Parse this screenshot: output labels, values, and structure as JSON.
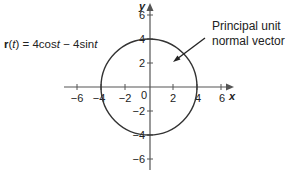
{
  "figure": {
    "equation": {
      "bold": "r",
      "open": "(",
      "var": "t",
      "close": ") = 4cos",
      "var2": "t",
      "mid": " − 4sin",
      "var3": "t"
    },
    "callout": {
      "line1": "Principal unit",
      "line2": "normal vector"
    },
    "axes": {
      "x_label": "x",
      "y_label": "y",
      "origin_label": "0",
      "x_ticks": [
        "−6",
        "−4",
        "−2",
        "2",
        "4",
        "6"
      ],
      "y_ticks": [
        "6",
        "4",
        "2",
        "−2",
        "−4",
        "−6"
      ]
    },
    "circle": {
      "center": [
        0,
        0
      ],
      "radius": 4
    },
    "colors": {
      "curve": "#333333",
      "axes": "#555555",
      "text": "#222222"
    }
  }
}
